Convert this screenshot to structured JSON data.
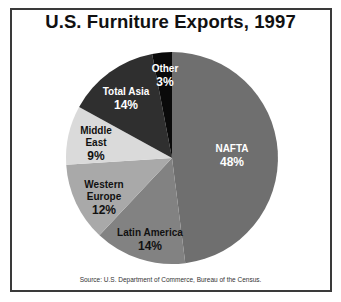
{
  "chart_data": {
    "type": "pie",
    "title": "U.S. Furniture Exports, 1997",
    "source": "Source: U.S. Department of Commerce, Bureau of the Census.",
    "unit": "%",
    "slices": [
      {
        "label": "NAFTA",
        "value": 48,
        "color": "#6f6f6f",
        "text_color": "#ffffff",
        "label_lines": [
          "NAFTA"
        ],
        "label_pos": [
          232,
          152
        ]
      },
      {
        "label": "Latin America",
        "value": 14,
        "color": "#828282",
        "text_color": "#111111",
        "label_lines": [
          "Latin America"
        ],
        "label_pos": [
          150,
          236
        ]
      },
      {
        "label": "Western Europe",
        "value": 12,
        "color": "#a9a9a9",
        "text_color": "#111111",
        "label_lines": [
          "Western",
          "Europe"
        ],
        "label_pos": [
          104,
          188
        ]
      },
      {
        "label": "Middle East",
        "value": 9,
        "color": "#dadada",
        "text_color": "#111111",
        "label_lines": [
          "Middle",
          "East"
        ],
        "label_pos": [
          96,
          134
        ]
      },
      {
        "label": "Total Asia",
        "value": 14,
        "color": "#2f2f2f",
        "text_color": "#ffffff",
        "label_lines": [
          "Total Asia"
        ],
        "label_pos": [
          126,
          95
        ]
      },
      {
        "label": "Other",
        "value": 3,
        "color": "#0a0a0a",
        "text_color": "#ffffff",
        "label_lines": [
          "Other"
        ],
        "label_pos": [
          165,
          72
        ]
      }
    ],
    "center": [
      172,
      158
    ],
    "radius": 106,
    "start_angle_deg": 0,
    "direction": "clockwise"
  }
}
